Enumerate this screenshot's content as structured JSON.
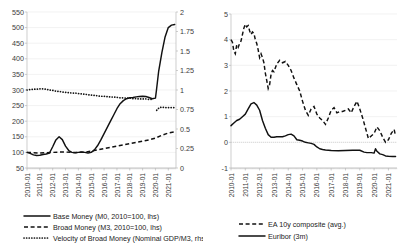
{
  "chart_data": [
    {
      "type": "line",
      "title": "",
      "panel": "left",
      "xlabel": "",
      "ylabel": "",
      "grid": true,
      "legend_position": "bottom",
      "x_tick_labels": [
        "2010-01",
        "2011-01",
        "2012-01",
        "2013-01",
        "2014-01",
        "2015-01",
        "2016-01",
        "2017-01",
        "2018-01",
        "2019-01",
        "2020-01",
        "2021-01"
      ],
      "y_left": {
        "label": "",
        "ylim": [
          50,
          550
        ],
        "ticks": [
          50,
          100,
          150,
          200,
          250,
          300,
          350,
          400,
          450,
          500,
          550
        ]
      },
      "y_right": {
        "label": "",
        "ylim": [
          0,
          2
        ],
        "ticks": [
          0,
          0.25,
          0.5,
          0.75,
          1,
          1.25,
          1.5,
          1.75,
          2
        ]
      },
      "series": [
        {
          "name": "Base Money (M0, 2010=100, lhs)",
          "style": "solid",
          "axis": "left",
          "x": [
            2010.0,
            2010.25,
            2010.5,
            2010.75,
            2011.0,
            2011.25,
            2011.5,
            2011.75,
            2012.0,
            2012.25,
            2012.5,
            2012.75,
            2013.0,
            2013.25,
            2013.5,
            2013.75,
            2014.0,
            2014.25,
            2014.5,
            2014.75,
            2015.0,
            2015.25,
            2015.5,
            2015.75,
            2016.0,
            2016.25,
            2016.5,
            2016.75,
            2017.0,
            2017.25,
            2017.5,
            2017.75,
            2018.0,
            2018.25,
            2018.5,
            2018.75,
            2019.0,
            2019.25,
            2019.5,
            2019.75,
            2020.0,
            2020.08,
            2020.25,
            2020.5,
            2020.75,
            2021.0,
            2021.25,
            2021.5
          ],
          "values": [
            100,
            97,
            92,
            90,
            91,
            93,
            95,
            98,
            118,
            140,
            150,
            141,
            120,
            106,
            100,
            99,
            100,
            101,
            100,
            98,
            100,
            108,
            122,
            140,
            160,
            180,
            200,
            220,
            240,
            256,
            266,
            272,
            275,
            276,
            278,
            279,
            280,
            279,
            276,
            272,
            274,
            300,
            360,
            420,
            470,
            500,
            508,
            510
          ]
        },
        {
          "name": "Broad Money (M3, 2010=100, lhs)",
          "style": "dashed",
          "axis": "left",
          "x": [
            2010.0,
            2010.5,
            2011.0,
            2011.5,
            2012.0,
            2012.5,
            2013.0,
            2013.5,
            2014.0,
            2014.5,
            2015.0,
            2015.5,
            2016.0,
            2016.5,
            2017.0,
            2017.5,
            2018.0,
            2018.5,
            2019.0,
            2019.5,
            2020.0,
            2020.5,
            2021.0,
            2021.5
          ],
          "values": [
            100,
            99,
            98,
            99,
            100,
            101,
            101,
            100,
            100,
            101,
            104,
            108,
            112,
            116,
            120,
            124,
            128,
            132,
            136,
            140,
            146,
            155,
            162,
            166
          ]
        },
        {
          "name": "Velocity of Broad Money (Nominal GDP/M3, rhs)",
          "style": "dotted",
          "axis": "right",
          "x": [
            2010.0,
            2010.25,
            2010.5,
            2010.75,
            2011.0,
            2011.25,
            2011.5,
            2011.75,
            2012.0,
            2012.25,
            2012.5,
            2012.75,
            2013.0,
            2013.25,
            2013.5,
            2013.75,
            2014.0,
            2014.25,
            2014.5,
            2014.75,
            2015.0,
            2015.25,
            2015.5,
            2015.75,
            2016.0,
            2016.25,
            2016.5,
            2016.75,
            2017.0,
            2017.25,
            2017.5,
            2017.75,
            2018.0,
            2018.25,
            2018.5,
            2018.75,
            2019.0,
            2019.25,
            2019.5,
            2019.75
          ],
          "values": [
            1.0,
            1.005,
            1.01,
            1.01,
            1.015,
            1.015,
            1.01,
            1.0,
            0.995,
            0.985,
            0.98,
            0.975,
            0.97,
            0.965,
            0.96,
            0.96,
            0.955,
            0.95,
            0.945,
            0.94,
            0.935,
            0.93,
            0.925,
            0.92,
            0.92,
            0.915,
            0.91,
            0.91,
            0.905,
            0.9,
            0.9,
            0.895,
            0.895,
            0.89,
            0.89,
            0.885,
            0.885,
            0.885,
            0.88,
            0.88
          ],
          "segment2_x": [
            2020.1,
            2020.3,
            2020.5,
            2020.75,
            2021.0,
            2021.25,
            2021.5
          ],
          "segment2_values": [
            0.74,
            0.775,
            0.78,
            0.775,
            0.775,
            0.775,
            0.775
          ]
        }
      ],
      "legend": [
        {
          "label": "Base Money (M0, 2010=100, lhs)",
          "style": "solid"
        },
        {
          "label": "Broad Money (M3, 2010=100, lhs)",
          "style": "dashed"
        },
        {
          "label": "Velocity of Broad Money (Nominal GDP/M3, rhs)",
          "style": "dotted"
        }
      ]
    },
    {
      "type": "line",
      "title": "",
      "panel": "right",
      "xlabel": "",
      "ylabel": "",
      "grid": true,
      "legend_position": "bottom",
      "x_tick_labels": [
        "2010-01",
        "2011-01",
        "2012-01",
        "2013-01",
        "2014-01",
        "2015-01",
        "2016-01",
        "2017-01",
        "2018-01",
        "2019-01",
        "2020-01",
        "2021-01"
      ],
      "y_left": {
        "label": "",
        "ylim": [
          -1.0,
          5.0
        ],
        "ticks": [
          -1.0,
          0.0,
          1.0,
          2.0,
          3.0,
          4.0,
          5.0
        ]
      },
      "series": [
        {
          "name": "EA 10y composite (avg.)",
          "style": "dashed",
          "axis": "left",
          "x": [
            2010.0,
            2010.1,
            2010.2,
            2010.3,
            2010.4,
            2010.5,
            2010.6,
            2010.7,
            2010.8,
            2010.9,
            2011.0,
            2011.1,
            2011.2,
            2011.3,
            2011.4,
            2011.5,
            2011.6,
            2011.7,
            2011.8,
            2011.9,
            2012.0,
            2012.1,
            2012.2,
            2012.3,
            2012.4,
            2012.5,
            2012.6,
            2012.7,
            2012.8,
            2012.9,
            2013.0,
            2013.2,
            2013.4,
            2013.6,
            2013.8,
            2014.0,
            2014.2,
            2014.4,
            2014.6,
            2014.8,
            2015.0,
            2015.2,
            2015.4,
            2015.6,
            2015.8,
            2016.0,
            2016.2,
            2016.4,
            2016.6,
            2016.8,
            2017.0,
            2017.2,
            2017.4,
            2017.6,
            2017.8,
            2018.0,
            2018.2,
            2018.4,
            2018.6,
            2018.8,
            2019.0,
            2019.2,
            2019.4,
            2019.6,
            2019.8,
            2020.0,
            2020.2,
            2020.4,
            2020.6,
            2020.8,
            2021.0,
            2021.2,
            2021.4,
            2021.5
          ],
          "values": [
            4.0,
            3.9,
            3.55,
            3.45,
            3.8,
            3.7,
            3.85,
            3.95,
            4.2,
            4.45,
            4.6,
            4.5,
            4.55,
            4.35,
            4.2,
            4.3,
            4.25,
            4.0,
            3.85,
            3.6,
            3.3,
            3.45,
            3.3,
            3.1,
            2.7,
            2.4,
            2.1,
            2.25,
            2.65,
            2.8,
            2.75,
            3.05,
            3.2,
            3.1,
            3.15,
            3.0,
            2.8,
            2.5,
            2.25,
            2.0,
            1.6,
            1.25,
            1.05,
            1.3,
            1.4,
            1.1,
            0.95,
            0.85,
            0.7,
            0.95,
            1.25,
            1.35,
            1.15,
            1.2,
            1.2,
            1.25,
            1.3,
            1.15,
            1.4,
            1.6,
            1.3,
            0.95,
            0.55,
            0.15,
            0.25,
            0.35,
            0.6,
            0.45,
            0.2,
            0.0,
            0.1,
            0.35,
            0.5,
            0.25
          ]
        },
        {
          "name": "Euribor (3m)",
          "style": "solid",
          "axis": "left",
          "x": [
            2010.0,
            2010.2,
            2010.4,
            2010.6,
            2010.8,
            2011.0,
            2011.2,
            2011.4,
            2011.6,
            2011.8,
            2012.0,
            2012.2,
            2012.4,
            2012.6,
            2012.8,
            2013.0,
            2013.2,
            2013.4,
            2013.6,
            2013.8,
            2014.0,
            2014.2,
            2014.4,
            2014.6,
            2014.8,
            2015.0,
            2015.2,
            2015.4,
            2015.6,
            2015.8,
            2016.0,
            2016.2,
            2016.4,
            2016.6,
            2016.8,
            2017.0,
            2017.5,
            2018.0,
            2018.5,
            2019.0,
            2019.3,
            2019.5,
            2019.8,
            2020.0,
            2020.1,
            2020.2,
            2020.4,
            2020.6,
            2020.8,
            2021.0,
            2021.3,
            2021.5
          ],
          "values": [
            0.65,
            0.75,
            0.85,
            0.9,
            1.0,
            1.1,
            1.3,
            1.5,
            1.55,
            1.45,
            1.25,
            0.85,
            0.55,
            0.3,
            0.2,
            0.2,
            0.22,
            0.22,
            0.22,
            0.25,
            0.3,
            0.32,
            0.25,
            0.1,
            0.08,
            0.05,
            0.0,
            -0.02,
            -0.04,
            -0.08,
            -0.18,
            -0.25,
            -0.28,
            -0.3,
            -0.31,
            -0.32,
            -0.33,
            -0.32,
            -0.31,
            -0.31,
            -0.38,
            -0.4,
            -0.4,
            -0.42,
            -0.25,
            -0.35,
            -0.45,
            -0.48,
            -0.53,
            -0.54,
            -0.55,
            -0.55
          ]
        }
      ],
      "legend": [
        {
          "label": "EA 10y composite (avg.)",
          "style": "dashed"
        },
        {
          "label": "Euribor (3m)",
          "style": "solid"
        }
      ]
    }
  ]
}
